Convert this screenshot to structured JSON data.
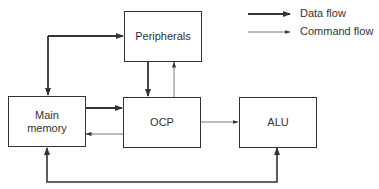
{
  "diagram": {
    "nodes": [
      {
        "id": "peripherals",
        "label": "Peripherals"
      },
      {
        "id": "main_memory",
        "label": "Main memory",
        "label_lines": [
          "Main",
          "memory"
        ]
      },
      {
        "id": "ocp",
        "label": "OCP"
      },
      {
        "id": "alu",
        "label": "ALU"
      }
    ],
    "edges": [
      {
        "from": "main_memory",
        "to": "peripherals",
        "type": "data",
        "bidirectional": true
      },
      {
        "from": "peripherals",
        "to": "ocp",
        "type": "data"
      },
      {
        "from": "ocp",
        "to": "peripherals",
        "type": "command"
      },
      {
        "from": "main_memory",
        "to": "ocp",
        "type": "data"
      },
      {
        "from": "ocp",
        "to": "main_memory",
        "type": "command"
      },
      {
        "from": "ocp",
        "to": "alu",
        "type": "command"
      },
      {
        "from": "main_memory",
        "to": "alu",
        "type": "data",
        "bidirectional": true
      }
    ],
    "legend": {
      "data_flow": "Data flow",
      "command_flow": "Command flow"
    },
    "colors": {
      "line": "#333333",
      "background": "#ffffff"
    }
  }
}
